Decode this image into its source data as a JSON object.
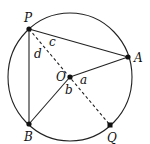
{
  "diagram": {
    "type": "circle-geometry",
    "circle": {
      "cx": 70,
      "cy": 77,
      "rx": 62,
      "ry": 64,
      "stroke": "#222222"
    },
    "points": {
      "P": {
        "x": 29,
        "y": 29,
        "label": "P"
      },
      "A": {
        "x": 128,
        "y": 57,
        "label": "A"
      },
      "O": {
        "x": 70,
        "y": 77,
        "label": "O"
      },
      "B": {
        "x": 29,
        "y": 124,
        "label": "B"
      },
      "Q": {
        "x": 110,
        "y": 125,
        "label": "Q"
      }
    },
    "segments_solid": [
      "PA",
      "PB",
      "OA",
      "OB"
    ],
    "segments_dashed": [
      "PQ"
    ],
    "angle_labels": {
      "a": "a",
      "b": "b",
      "c": "c",
      "d": "d"
    },
    "point_labels": {
      "P": "P",
      "A": "A",
      "O": "O",
      "B": "B",
      "Q": "Q"
    }
  }
}
